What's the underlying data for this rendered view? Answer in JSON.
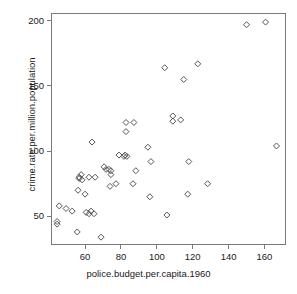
{
  "chart_data": {
    "type": "scatter",
    "title": "",
    "xlabel": "police.budget.per.capita.1960",
    "ylabel": "crime.rate.per.million.population",
    "xlim": [
      41,
      172
    ],
    "ylim": [
      28,
      206
    ],
    "xticks": [
      60,
      80,
      100,
      120,
      140,
      160
    ],
    "yticks": [
      50,
      100,
      150,
      200
    ],
    "xtick_labels": [
      "60",
      "80",
      "100",
      "120",
      "140",
      "160"
    ],
    "ytick_labels": [
      "50",
      "100",
      "150",
      "200"
    ],
    "grid": false,
    "legend": null,
    "marker": "diamond-open",
    "marker_color": "#555555",
    "points": [
      {
        "x": 45.6,
        "y": 58.0
      },
      {
        "x": 44.4,
        "y": 46.0
      },
      {
        "x": 44.4,
        "y": 44.0
      },
      {
        "x": 49.4,
        "y": 56.0
      },
      {
        "x": 52.8,
        "y": 54.0
      },
      {
        "x": 55.6,
        "y": 38.0
      },
      {
        "x": 56.7,
        "y": 80.0
      },
      {
        "x": 57.8,
        "y": 82.0
      },
      {
        "x": 56.7,
        "y": 79.0
      },
      {
        "x": 58.3,
        "y": 78.0
      },
      {
        "x": 62.2,
        "y": 80.0
      },
      {
        "x": 65.6,
        "y": 80.0
      },
      {
        "x": 56.1,
        "y": 70.0
      },
      {
        "x": 60.0,
        "y": 67.0
      },
      {
        "x": 60.6,
        "y": 53.0
      },
      {
        "x": 62.2,
        "y": 52.0
      },
      {
        "x": 63.3,
        "y": 54.0
      },
      {
        "x": 65.0,
        "y": 52.0
      },
      {
        "x": 63.9,
        "y": 107.0
      },
      {
        "x": 70.6,
        "y": 88.0
      },
      {
        "x": 71.7,
        "y": 86.0
      },
      {
        "x": 68.9,
        "y": 34.0
      },
      {
        "x": 73.9,
        "y": 73.0
      },
      {
        "x": 77.2,
        "y": 75.0
      },
      {
        "x": 74.4,
        "y": 85.0
      },
      {
        "x": 74.4,
        "y": 82.0
      },
      {
        "x": 73.3,
        "y": 86.0
      },
      {
        "x": 82.8,
        "y": 122.0
      },
      {
        "x": 87.2,
        "y": 122.0
      },
      {
        "x": 82.8,
        "y": 115.0
      },
      {
        "x": 78.9,
        "y": 97.0
      },
      {
        "x": 81.7,
        "y": 96.0
      },
      {
        "x": 83.3,
        "y": 96.0
      },
      {
        "x": 82.2,
        "y": 97.0
      },
      {
        "x": 95.0,
        "y": 103.0
      },
      {
        "x": 88.3,
        "y": 85.0
      },
      {
        "x": 96.7,
        "y": 92.0
      },
      {
        "x": 86.7,
        "y": 75.0
      },
      {
        "x": 96.1,
        "y": 65.0
      },
      {
        "x": 104.4,
        "y": 164.0
      },
      {
        "x": 108.9,
        "y": 127.0
      },
      {
        "x": 108.9,
        "y": 123.0
      },
      {
        "x": 113.3,
        "y": 124.0
      },
      {
        "x": 115.0,
        "y": 155.0
      },
      {
        "x": 122.8,
        "y": 167.0
      },
      {
        "x": 117.8,
        "y": 92.0
      },
      {
        "x": 105.6,
        "y": 51.0
      },
      {
        "x": 117.2,
        "y": 67.0
      },
      {
        "x": 128.3,
        "y": 75.0
      },
      {
        "x": 150.0,
        "y": 197.0
      },
      {
        "x": 160.6,
        "y": 199.0
      },
      {
        "x": 166.7,
        "y": 104.0
      }
    ]
  }
}
